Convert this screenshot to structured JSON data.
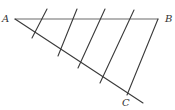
{
  "diagram": {
    "type": "geometry-construction",
    "labels": {
      "A": "A",
      "B": "B",
      "C": "C"
    },
    "points": {
      "A": [
        15,
        19
      ],
      "B": [
        158,
        19
      ],
      "C_end": [
        143,
        103
      ]
    },
    "transversals": [
      {
        "x1": 47,
        "y1": 9,
        "x2": 32,
        "y2": 38
      },
      {
        "x1": 77,
        "y1": 9,
        "x2": 58,
        "y2": 56
      },
      {
        "x1": 105,
        "y1": 9,
        "x2": 78,
        "y2": 68
      },
      {
        "x1": 134,
        "y1": 10,
        "x2": 100,
        "y2": 83
      },
      {
        "x1": 158,
        "y1": 19,
        "x2": 127,
        "y2": 95
      }
    ],
    "colors": {
      "line": "#3a3a3a",
      "ab_line": "#6a6a6a",
      "label": "#333333",
      "background": "#ffffff"
    }
  }
}
